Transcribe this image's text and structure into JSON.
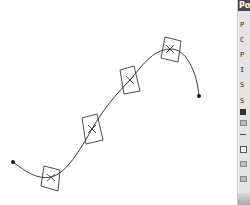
{
  "viewport": {
    "curve": {
      "type": "spline",
      "color": "#3a3a3a",
      "start_point": {
        "x": 13,
        "y": 162
      },
      "end_point": {
        "x": 199,
        "y": 96
      },
      "control_points": [
        {
          "x": 51,
          "y": 177
        },
        {
          "x": 92,
          "y": 129
        },
        {
          "x": 130,
          "y": 80
        },
        {
          "x": 170,
          "y": 49
        }
      ]
    }
  },
  "panel": {
    "title": "Po",
    "rows": [
      {
        "label": "P"
      },
      {
        "label": "C"
      },
      {
        "label": "P"
      },
      {
        "label": "I"
      },
      {
        "label": "S"
      },
      {
        "label": "S"
      }
    ]
  }
}
